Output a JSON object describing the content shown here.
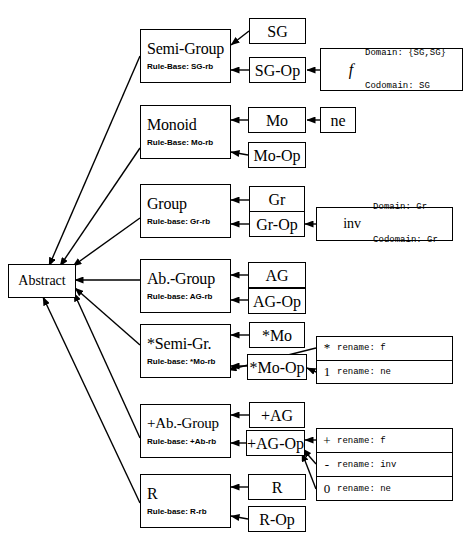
{
  "diagram": {
    "root": {
      "label": "Abstract"
    },
    "rows": [
      {
        "id": "semi-group",
        "class_name": "Semi-Group",
        "rule_base": "Rule-Base: SG-rb",
        "sort_op": "SG",
        "op_op": "SG-Op",
        "detail": {
          "symbol": "f",
          "line1": "Domain: {SG,SG}",
          "line2": "Codomain: SG"
        }
      },
      {
        "id": "monoid",
        "class_name": "Monoid",
        "rule_base": "Rule-Base: Mo-rb",
        "sort_op": "Mo",
        "sort_extra": "ne",
        "op_op": "Mo-Op"
      },
      {
        "id": "group",
        "class_name": "Group",
        "rule_base": "Rule-base: Gr-rb",
        "sort_op": "Gr",
        "op_op": "Gr-Op",
        "detail": {
          "symbol": "inv",
          "line1": "Domain: Gr",
          "line2": "Codomain: Gr"
        }
      },
      {
        "id": "ab-group",
        "class_name": "Ab.-Group",
        "rule_base": "Rule-base: AG-rb",
        "sort_op": "AG",
        "op_op": "AG-Op"
      },
      {
        "id": "star-semi-gr",
        "class_name": "*Semi-Gr.",
        "rule_base": "Rule-base: *Mo-rb",
        "sort_op": "*Mo",
        "op_op": "*Mo-Op",
        "renames": [
          {
            "symbol": "*",
            "label": "rename: f"
          },
          {
            "symbol": "1",
            "label": "rename: ne"
          }
        ]
      },
      {
        "id": "plus-ab-group",
        "class_name": "+Ab.-Group",
        "rule_base": "Rule-base: +Ab-rb",
        "sort_op": "+AG",
        "op_op": "+AG-Op",
        "renames": [
          {
            "symbol": "+",
            "label": "rename: f"
          },
          {
            "symbol": "-",
            "label": "rename: inv"
          },
          {
            "symbol": "0",
            "label": "rename: ne"
          }
        ]
      },
      {
        "id": "ring",
        "class_name": "R",
        "rule_base": "Rule-base: R-rb",
        "sort_op": "R",
        "op_op": "R-Op"
      }
    ],
    "colors": {
      "line": "#000000",
      "background": "#ffffff"
    }
  }
}
